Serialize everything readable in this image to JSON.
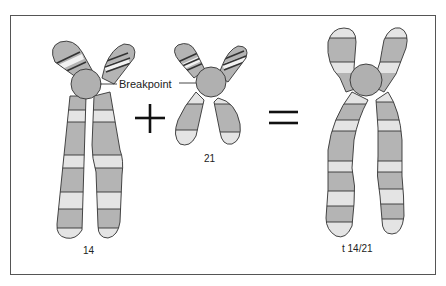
{
  "diagram": {
    "colors": {
      "dark_band": "#b4b4b4",
      "light_band": "#e4e4e4",
      "centromere": "#b0b0b0",
      "outline": "#333333",
      "frame": "#555555"
    },
    "labels": {
      "breakpoint": "Breakpoint",
      "chromosome_14": "14",
      "chromosome_21": "21",
      "translocation": "t 14/21",
      "plus": "+",
      "equals": "="
    }
  }
}
